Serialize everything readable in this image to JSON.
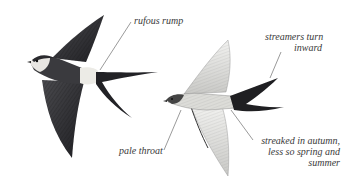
{
  "figure": {
    "colors": {
      "background": "#ffffff",
      "dark_plumage": "#2b2b2e",
      "pale_plumage": "#e4e4e2",
      "rump": "#e9e6e0",
      "label_text": "#3a3a3a",
      "leader_line": "#555555"
    }
  },
  "labels": {
    "rump": "rufous rump",
    "streamers_line1": "streamers turn",
    "streamers_line2": "inward",
    "throat": "pale throat",
    "streaked_line1": "streaked in autumn,",
    "streaked_line2": "less so spring and",
    "streaked_line3": "summer"
  }
}
